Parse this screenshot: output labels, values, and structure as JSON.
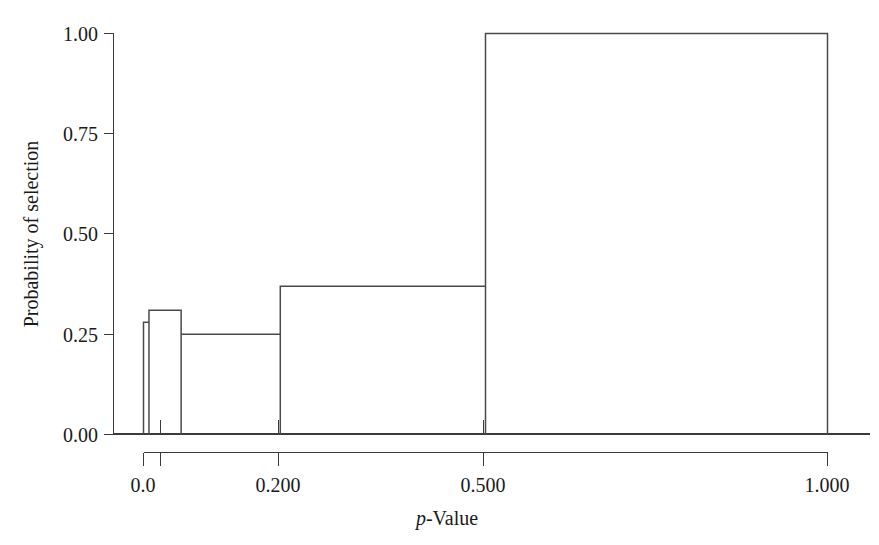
{
  "chart_data": {
    "type": "bar",
    "title": "",
    "subtitle": "",
    "xlabel": "p-Value",
    "xlabel_italic_prefix": "p",
    "xlabel_rest": "-Value",
    "ylabel": "Probability of selection",
    "xlim": [
      0.0,
      1.0
    ],
    "ylim": [
      0.0,
      1.0
    ],
    "grid": false,
    "legend": null,
    "x_ticks": [
      {
        "value": 0.0,
        "label": "0.0"
      },
      {
        "value": 0.05,
        "label": ""
      },
      {
        "value": 0.2,
        "label": "0.200"
      },
      {
        "value": 0.5,
        "label": "0.500"
      },
      {
        "value": 1.0,
        "label": "1.000"
      }
    ],
    "y_ticks": [
      {
        "value": 0.0,
        "label": "0.00"
      },
      {
        "value": 0.25,
        "label": "0.25"
      },
      {
        "value": 0.5,
        "label": "0.50"
      },
      {
        "value": 0.75,
        "label": "0.75"
      },
      {
        "value": 1.0,
        "label": "1.00"
      }
    ],
    "bins": [
      {
        "x0": 0.0,
        "x1": 0.008,
        "value": 0.28
      },
      {
        "x0": 0.008,
        "x1": 0.055,
        "value": 0.31
      },
      {
        "x0": 0.055,
        "x1": 0.2,
        "value": 0.25
      },
      {
        "x0": 0.2,
        "x1": 0.5,
        "value": 0.37
      },
      {
        "x0": 0.5,
        "x1": 1.0,
        "value": 1.0
      }
    ],
    "categories": [
      "0.000-0.008",
      "0.008-0.055",
      "0.055-0.200",
      "0.200-0.500",
      "0.500-1.000"
    ],
    "values": [
      0.28,
      0.31,
      0.25,
      0.37,
      1.0
    ]
  },
  "colors": {
    "line": "#4a4a4a",
    "axis": "#3a3a3a",
    "text": "#1a1a1a",
    "background": "#ffffff"
  }
}
